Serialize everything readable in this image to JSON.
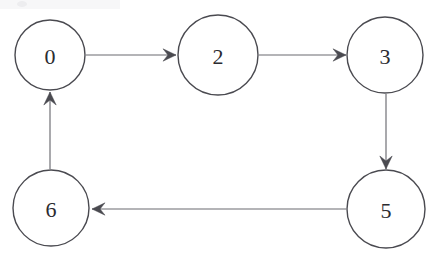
{
  "figure": {
    "background_color": "#ffffff",
    "node_stroke_color": "#4a4a50",
    "node_fill_color": "#ffffff",
    "edge_color": "#6a6a70",
    "label_color": "#2b2b30"
  },
  "nodes": [
    {
      "id": "0",
      "label": "0",
      "cx": 50,
      "cy": 55,
      "r": 35
    },
    {
      "id": "2",
      "label": "2",
      "cx": 218,
      "cy": 55,
      "r": 40
    },
    {
      "id": "3",
      "label": "3",
      "cx": 385,
      "cy": 55,
      "r": 38
    },
    {
      "id": "5",
      "label": "5",
      "cx": 386,
      "cy": 209,
      "r": 39
    },
    {
      "id": "6",
      "label": "6",
      "cx": 51,
      "cy": 208,
      "r": 38
    }
  ],
  "edges": [
    {
      "id": "e-0-2",
      "from": "0",
      "to": "2",
      "label": "",
      "direction": "right",
      "x1": 86,
      "y1": 55,
      "x2": 176,
      "y2": 55
    },
    {
      "id": "e-2-3",
      "from": "2",
      "to": "3",
      "label": "",
      "direction": "right",
      "x1": 259,
      "y1": 55,
      "x2": 346,
      "y2": 55
    },
    {
      "id": "e-3-5",
      "from": "3",
      "to": "5",
      "label": "",
      "direction": "down",
      "x1": 386,
      "y1": 94,
      "x2": 386,
      "y2": 169
    },
    {
      "id": "e-5-6",
      "from": "5",
      "to": "6",
      "label": "",
      "direction": "left",
      "x1": 346,
      "y1": 209,
      "x2": 92,
      "y2": 209
    },
    {
      "id": "e-6-0",
      "from": "6",
      "to": "0",
      "label": "",
      "direction": "up",
      "x1": 50,
      "y1": 169,
      "x2": 50,
      "y2": 92
    }
  ],
  "artifacts": [
    {
      "id": "corner-mark",
      "x": 18,
      "y": 2,
      "w": 9,
      "h": 5
    }
  ]
}
